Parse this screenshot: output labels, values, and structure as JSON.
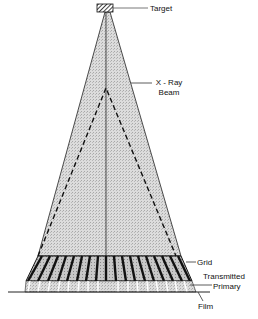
{
  "diagram": {
    "labels": {
      "target": "Target",
      "xray_beam_line1": "X - Ray",
      "xray_beam_line2": "Beam",
      "grid": "Grid",
      "transmitted_line1": "Transmitted",
      "transmitted_line2": "Primary",
      "film": "Film"
    },
    "components": [
      {
        "name": "Target",
        "shape": "hatched-block"
      },
      {
        "name": "X-Ray Beam",
        "shape": "shaded-triangle"
      },
      {
        "name": "Scatter cone",
        "shape": "dashed-triangle"
      },
      {
        "name": "Central ray",
        "shape": "vertical-line"
      },
      {
        "name": "Grid",
        "shape": "slanted-strip-band"
      },
      {
        "name": "Transmitted Primary",
        "shape": "band-below-grid"
      },
      {
        "name": "Film",
        "shape": "horizontal-line"
      }
    ],
    "colors": {
      "ink": "#111111",
      "beam_fill": "#d4d4d4",
      "grid_fill": "#b8b8b8"
    }
  }
}
